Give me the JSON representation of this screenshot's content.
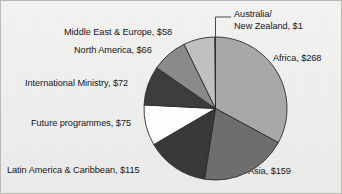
{
  "chart_data": {
    "type": "pie",
    "title": "",
    "subtitle": "",
    "xlabel": "",
    "ylabel": "",
    "legend_position": "none",
    "grid": false,
    "value_prefix": "$",
    "total": 814,
    "start_angle_deg": 0,
    "direction": "clockwise",
    "categories": [
      "Africa",
      "Asia",
      "Latin America & Caribbean",
      "Future programmes",
      "International Ministry",
      "North America",
      "Middle East & Europe",
      "Australia/New Zealand"
    ],
    "values": [
      268,
      159,
      115,
      75,
      72,
      66,
      58,
      1
    ],
    "slices": [
      {
        "name": "Africa",
        "value": 268,
        "label": "Africa, $268",
        "color": "#a9a9a9",
        "leader_line": false
      },
      {
        "name": "Asia",
        "value": 159,
        "label": "Asia, $159",
        "color": "#6f6f6f",
        "leader_line": false
      },
      {
        "name": "Latin America & Caribbean",
        "value": 115,
        "label": "Latin America & Caribbean, $115",
        "color": "#393939",
        "leader_line": false
      },
      {
        "name": "Future programmes",
        "value": 75,
        "label": "Future programmes, $75",
        "color": "#ffffff",
        "leader_line": false
      },
      {
        "name": "International Ministry",
        "value": 72,
        "label": "International Ministry, $72",
        "color": "#3d3d3d",
        "leader_line": false
      },
      {
        "name": "North America",
        "value": 66,
        "label": "North America, $66",
        "color": "#8b8b8b",
        "leader_line": false
      },
      {
        "name": "Middle East & Europe",
        "value": 58,
        "label": "Middle East & Europe, $58",
        "color": "#c2c2c2",
        "leader_line": false
      },
      {
        "name": "Australia/New Zealand",
        "value": 1,
        "label": "Australia/ New Zealand, $1",
        "color": "#d8d8d8",
        "leader_line": true
      }
    ]
  },
  "labels": {
    "australia_line1": "Australia/",
    "australia_line2": "New Zealand, $1",
    "africa": "Africa, $268",
    "asia": "Asia, $159",
    "latin_america": "Latin America & Caribbean, $115",
    "future_programmes": "Future programmes, $75",
    "international_ministry": "International Ministry, $72",
    "north_america": "North America, $66",
    "middle_east_europe": "Middle East & Europe, $58"
  },
  "style": {
    "background": "#f1f1ef",
    "border_color": "#b9b9b5",
    "text_color": "#15151a",
    "slice_outline": "#2b2b2b",
    "leader_line_color": "#4a4a4a"
  }
}
